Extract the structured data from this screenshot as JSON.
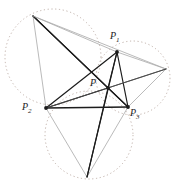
{
  "figure": {
    "kind": "geometry-diagram",
    "width": 176,
    "height": 190,
    "background_color": "#ffffff"
  },
  "colors": {
    "dark_line": "#1c1c1c",
    "mid_line": "#4a4a4a",
    "light_line": "#a8a8a8",
    "circle_dotted": "#b9a8a0",
    "label_text": "#1b1b1b"
  },
  "points": {
    "P1": {
      "label": "P",
      "sub": "1",
      "x": 117,
      "y": 52,
      "label_x": 110,
      "label_y": 31
    },
    "P2": {
      "label": "P",
      "sub": "2",
      "x": 46,
      "y": 108,
      "label_x": 22,
      "label_y": 102
    },
    "P3": {
      "label": "P",
      "sub": "3",
      "x": 128,
      "y": 107,
      "label_x": 130,
      "label_y": 108
    },
    "P": {
      "label": "P",
      "sub": "",
      "x": 108,
      "y": 88,
      "label_x": 90,
      "label_y": 78
    },
    "A": {
      "label": "",
      "sub": "",
      "x": 33,
      "y": 16
    },
    "B": {
      "label": "",
      "sub": "",
      "x": 166,
      "y": 69
    },
    "C": {
      "label": "",
      "sub": "",
      "x": 87,
      "y": 177
    }
  },
  "circles": [
    {
      "name": "circle-left",
      "cx": 53,
      "cy": 57,
      "r": 48,
      "stroke": "#b9a8a0",
      "dash": "1.2 2.6"
    },
    {
      "name": "circle-right",
      "cx": 133,
      "cy": 78,
      "r": 37,
      "stroke": "#b9a8a0",
      "dash": "1.2 2.6"
    },
    {
      "name": "circle-bottom",
      "cx": 89,
      "cy": 135,
      "r": 44,
      "stroke": "#b9a8a0",
      "dash": "1.2 2.6"
    }
  ],
  "segments": [
    {
      "name": "seg-P2-P3",
      "from": "P2",
      "to": "P3",
      "weight": "dark",
      "width": 1.5
    },
    {
      "name": "seg-P1-P2",
      "from": "P1",
      "to": "P2",
      "weight": "dark",
      "width": 1.2
    },
    {
      "name": "seg-P1-P3",
      "from": "P1",
      "to": "P3",
      "weight": "dark",
      "width": 1.2
    },
    {
      "name": "seg-P-P1",
      "from": "P",
      "to": "P1",
      "weight": "dark",
      "width": 1.1
    },
    {
      "name": "seg-P-P2",
      "from": "P",
      "to": "P2",
      "weight": "dark",
      "width": 1.1
    },
    {
      "name": "seg-P-P3",
      "from": "P",
      "to": "P3",
      "weight": "dark",
      "width": 1.1
    },
    {
      "name": "seg-A-P1",
      "from": "A",
      "to": "P1",
      "weight": "light",
      "width": 0.8
    },
    {
      "name": "seg-A-P2",
      "from": "A",
      "to": "P2",
      "weight": "light",
      "width": 0.8
    },
    {
      "name": "seg-A-P",
      "from": "A",
      "to": "P",
      "weight": "dark",
      "width": 1.2
    },
    {
      "name": "seg-A-P3",
      "from": "A",
      "to": "P3",
      "weight": "dark",
      "width": 1.1
    },
    {
      "name": "seg-A-B",
      "from": "A",
      "to": "B",
      "weight": "light",
      "width": 0.8
    },
    {
      "name": "seg-B-P1",
      "from": "B",
      "to": "P1",
      "weight": "light",
      "width": 0.8
    },
    {
      "name": "seg-B-P3",
      "from": "B",
      "to": "P3",
      "weight": "light",
      "width": 0.8
    },
    {
      "name": "seg-B-P",
      "from": "B",
      "to": "P",
      "weight": "mid",
      "width": 0.9
    },
    {
      "name": "seg-B-P2",
      "from": "B",
      "to": "P2",
      "weight": "mid",
      "width": 0.9
    },
    {
      "name": "seg-C-P2",
      "from": "C",
      "to": "P2",
      "weight": "light",
      "width": 0.8
    },
    {
      "name": "seg-C-P3",
      "from": "C",
      "to": "P3",
      "weight": "light",
      "width": 0.8
    },
    {
      "name": "seg-C-P",
      "from": "C",
      "to": "P",
      "weight": "dark",
      "width": 1.1
    },
    {
      "name": "seg-C-P1",
      "from": "C",
      "to": "P1",
      "weight": "dark",
      "width": 1.1
    }
  ],
  "vertex_dots": [
    {
      "name": "dot-P1",
      "at": "P1",
      "r": 1.9
    },
    {
      "name": "dot-P2",
      "at": "P2",
      "r": 1.9
    },
    {
      "name": "dot-P3",
      "at": "P3",
      "r": 1.9
    },
    {
      "name": "dot-P",
      "at": "P",
      "r": 1.9
    }
  ]
}
